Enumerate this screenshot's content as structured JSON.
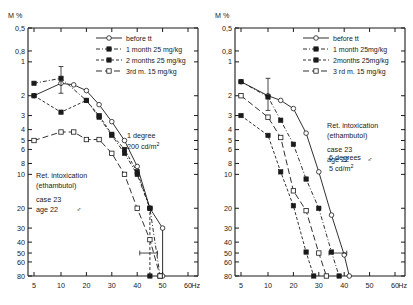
{
  "figure": {
    "axis_y_unit": "M %",
    "axis_x_unit": "Hz"
  },
  "chart_data": [
    {
      "type": "line",
      "title": "1 degree",
      "subtitle": "200 cd/m2",
      "xlabel": "Hz",
      "ylabel": "M %",
      "x_ticks": [
        5,
        10,
        20,
        30,
        40,
        50,
        60
      ],
      "x_tick_labels": [
        "5",
        "10",
        "20",
        "30",
        "40",
        "50",
        "60"
      ],
      "y_ticks": [
        0.5,
        0.8,
        1,
        2,
        3,
        4,
        5,
        6,
        8,
        10,
        20,
        30,
        40,
        50,
        60,
        80
      ],
      "y_tick_labels": [
        "0,5",
        "0,8",
        "1",
        "2",
        "3",
        "4",
        "5",
        "6",
        "8",
        "10",
        "20",
        "30",
        "40",
        "50",
        "60",
        "80"
      ],
      "y_inverted": true,
      "y_scale": "log",
      "grid": false,
      "legend_position": "top-right",
      "annotations": [
        "Ret. intoxication",
        "(ethambutol)",
        "case 23",
        "age 22   ♂"
      ],
      "series": [
        {
          "name": "before tt",
          "marker": "open-circle",
          "dash": "solid",
          "points": [
            [
              5,
              2.0
            ],
            [
              10,
              1.55
            ],
            [
              15,
              1.6
            ],
            [
              20,
              1.8
            ],
            [
              25,
              2.4
            ],
            [
              30,
              3.4
            ],
            [
              35,
              5.0
            ],
            [
              40,
              8.5
            ],
            [
              45,
              20
            ],
            [
              50,
              30
            ],
            [
              50,
              80
            ]
          ]
        },
        {
          "name": "1 month   25 mg/kg",
          "marker": "filled-square",
          "dash": "dash-dot",
          "points": [
            [
              5,
              1.55
            ],
            [
              10,
              1.4
            ],
            [
              20,
              2.2
            ],
            [
              25,
              3.1
            ],
            [
              30,
              4.5
            ],
            [
              35,
              6.5
            ],
            [
              40,
              10
            ],
            [
              45,
              20
            ],
            [
              49,
              80
            ]
          ],
          "errorbar": {
            "x": 10,
            "y_low": 1.1,
            "y_high": 1.9
          }
        },
        {
          "name": "2 months 25 mg/kg",
          "marker": "filled-square",
          "dash": "dash",
          "points": [
            [
              5,
              2.0
            ],
            [
              10,
              2.8
            ],
            [
              20,
              2.2
            ],
            [
              25,
              3.0
            ],
            [
              30,
              4.4
            ],
            [
              35,
              6.0
            ],
            [
              40,
              9.5
            ],
            [
              45,
              20
            ],
            [
              45,
              80
            ]
          ]
        },
        {
          "name": "3rd m.   15 mg/kg",
          "marker": "open-square",
          "dash": "long-dash",
          "points": [
            [
              5,
              5.0
            ],
            [
              10,
              4.2
            ],
            [
              15,
              4.2
            ],
            [
              20,
              4.9
            ],
            [
              25,
              4.9
            ],
            [
              30,
              6.5
            ],
            [
              35,
              10
            ],
            [
              40,
              20
            ],
            [
              45,
              38
            ],
            [
              49,
              80
            ]
          ],
          "errorbar": {
            "x_low": 41,
            "x_high": 48,
            "y": 50
          }
        }
      ]
    },
    {
      "type": "line",
      "title": "6 degrees",
      "subtitle": "5 cd/m2",
      "xlabel": "Hz",
      "ylabel": "M %",
      "x_ticks": [
        5,
        10,
        20,
        30,
        40,
        50,
        60
      ],
      "x_tick_labels": [
        "5",
        "10",
        "20",
        "30",
        "40",
        "50",
        "60"
      ],
      "y_ticks": [
        0.5,
        0.8,
        1,
        2,
        3,
        4,
        5,
        6,
        8,
        10,
        20,
        30,
        40,
        50,
        60,
        80
      ],
      "y_tick_labels": [
        "0,5",
        "0,8",
        "1",
        "2",
        "3",
        "4",
        "5",
        "6",
        "8",
        "10",
        "20",
        "30",
        "40",
        "50",
        "60",
        "80"
      ],
      "y_inverted": true,
      "y_scale": "log",
      "grid": false,
      "legend_position": "top-right",
      "annotations": [
        "Ret. intoxication",
        "(ethambutol)",
        "case 23",
        "age 22   ♂"
      ],
      "series": [
        {
          "name": "before tt",
          "marker": "open-circle",
          "dash": "solid",
          "points": [
            [
              5,
              1.5
            ],
            [
              10,
              2.0
            ],
            [
              15,
              2.2
            ],
            [
              20,
              2.6
            ],
            [
              25,
              4.3
            ],
            [
              30,
              9.5
            ],
            [
              35,
              23
            ],
            [
              40,
              52
            ],
            [
              42,
              80
            ]
          ]
        },
        {
          "name": "1 month  25mg/kg",
          "marker": "filled-square",
          "dash": "dash-dot",
          "points": [
            [
              5,
              1.5
            ],
            [
              10,
              2.05
            ],
            [
              15,
              3.3
            ],
            [
              20,
              5.4
            ],
            [
              25,
              11
            ],
            [
              30,
              20
            ],
            [
              35,
              49
            ],
            [
              38,
              80
            ]
          ],
          "errorbar": {
            "x": 10,
            "y_low": 1.4,
            "y_high": 2.7
          }
        },
        {
          "name": "2months 25mg/kg",
          "marker": "filled-square",
          "dash": "dash",
          "points": [
            [
              5,
              3.0
            ],
            [
              10,
              4.5
            ],
            [
              15,
              9.5
            ],
            [
              20,
              19
            ],
            [
              25,
              49
            ],
            [
              28,
              80
            ]
          ]
        },
        {
          "name": "3rd m. 15 mg/kg",
          "marker": "open-square",
          "dash": "long-dash",
          "points": [
            [
              5,
              2.0
            ],
            [
              10,
              3.1
            ],
            [
              15,
              4.7
            ],
            [
              20,
              14
            ],
            [
              25,
              21
            ],
            [
              30,
              50
            ],
            [
              33,
              80
            ]
          ],
          "errorbar": {
            "x_low": 34,
            "x_high": 41,
            "y": 50
          }
        }
      ]
    }
  ],
  "left_panel": {
    "y_unit": "M %",
    "x_unit": "Hz",
    "legend": [
      {
        "label": "before  tt",
        "marker": "open-circle",
        "dash": "solid"
      },
      {
        "label": "1 month   25 mg/kg",
        "marker": "filled-square",
        "dash": "dash-dot"
      },
      {
        "label": "2 months 25 mg/kg",
        "marker": "filled-square",
        "dash": "dash"
      },
      {
        "label": "3rd m.    15 mg/kg",
        "marker": "open-square",
        "dash": "long-dash"
      }
    ],
    "condition": {
      "line1": "1 degree",
      "line2": "200  cd/m",
      "exponent": "2"
    },
    "caption": {
      "line1": "Ret.  intoxication",
      "line2": "(ethambutol)",
      "line3": "case 23",
      "line4": "age 22",
      "sex": "♂"
    },
    "y_tick_labels": [
      "0,5",
      "0,8",
      "1",
      "2",
      "3",
      "4",
      "5",
      "6",
      "8",
      "10",
      "20",
      "30",
      "40",
      "50",
      "60",
      "80"
    ],
    "x_tick_labels": [
      "5",
      "10",
      "20",
      "30",
      "40",
      "50",
      "60"
    ]
  },
  "right_panel": {
    "y_unit": "M %",
    "x_unit": "Hz",
    "legend": [
      {
        "label": "before  tt",
        "marker": "open-circle",
        "dash": "solid"
      },
      {
        "label": "1 month  25mg/kg",
        "marker": "filled-square",
        "dash": "dash-dot"
      },
      {
        "label": "2months 25mg/kg",
        "marker": "filled-square",
        "dash": "dash"
      },
      {
        "label": "3 rd m. 15 mg/kg",
        "marker": "open-square",
        "dash": "long-dash"
      }
    ],
    "condition": {
      "line1": "6 degrees",
      "line2": "5 cd/m",
      "exponent": "2"
    },
    "caption": {
      "line1": "Ret. intoxication",
      "line2": "(ethambutol)",
      "line3": "case 23",
      "line4": "age 22",
      "sex": "♂"
    },
    "y_tick_labels": [
      "0,5",
      "0,8",
      "1",
      "2",
      "3",
      "4",
      "5",
      "6",
      "8",
      "10",
      "20",
      "30",
      "40",
      "50",
      "60",
      "80"
    ],
    "x_tick_labels": [
      "5",
      "10",
      "20",
      "30",
      "40",
      "50",
      "60"
    ]
  }
}
